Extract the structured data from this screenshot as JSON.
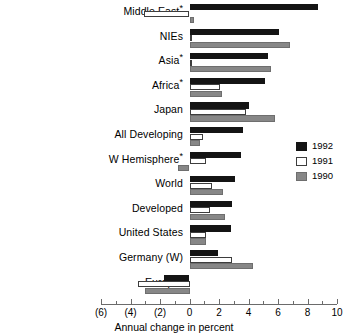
{
  "chart_data": {
    "type": "bar",
    "orientation": "horizontal",
    "title": "",
    "xlabel": "Annual change in percent",
    "ylabel": "",
    "xlim": [
      -6,
      10
    ],
    "xticks": [
      -6,
      -4,
      -2,
      0,
      2,
      4,
      6,
      8,
      10
    ],
    "xtick_labels": [
      "(6)",
      "(4)",
      "(2)",
      "0",
      "2",
      "4",
      "6",
      "8",
      "10"
    ],
    "minor_tick_interval": 1,
    "grid": false,
    "legend_position": "right",
    "categories": [
      "Middle East*",
      "NIEs",
      "Asia*",
      "Africa*",
      "Japan",
      "All Developing",
      "W Hemisphere*",
      "World",
      "Developed",
      "United States",
      "Germany (W)",
      "Europe*"
    ],
    "category_labels": [
      {
        "text": "Middle East",
        "star": true
      },
      {
        "text": "NIEs",
        "star": false
      },
      {
        "text": "Asia",
        "star": true
      },
      {
        "text": "Africa",
        "star": true
      },
      {
        "text": "Japan",
        "star": false
      },
      {
        "text": "All Developing",
        "star": false
      },
      {
        "text": "W Hemisphere",
        "star": true
      },
      {
        "text": "World",
        "star": false
      },
      {
        "text": "Developed",
        "star": false
      },
      {
        "text": "United States",
        "star": false
      },
      {
        "text": "Germany (W)",
        "star": false
      },
      {
        "text": "Europe",
        "star": true
      }
    ],
    "series": [
      {
        "name": "1992",
        "color": "#141414",
        "values": [
          8.7,
          6.1,
          5.3,
          5.1,
          4.0,
          3.6,
          3.5,
          3.1,
          2.9,
          2.8,
          1.9,
          -1.7
        ]
      },
      {
        "name": "1991",
        "color": "#ffffff",
        "values": [
          -3.1,
          0.0,
          0.0,
          2.1,
          3.8,
          0.9,
          1.1,
          1.5,
          1.4,
          1.1,
          2.9,
          -3.5
        ]
      },
      {
        "name": "1990",
        "color": "#878787",
        "values": [
          0.3,
          6.8,
          5.5,
          2.2,
          5.8,
          0.7,
          -0.8,
          2.3,
          2.4,
          1.1,
          4.3,
          -3.0
        ]
      }
    ]
  },
  "legend": {
    "entries": [
      {
        "label": "1992",
        "swatch": "black"
      },
      {
        "label": "1991",
        "swatch": "white"
      },
      {
        "label": "1990",
        "swatch": "gray"
      }
    ]
  },
  "axis": {
    "title": "Annual change in percent"
  },
  "colors": {
    "series_1992": "#141414",
    "series_1991": "#ffffff",
    "series_1990": "#878787",
    "axis": "#6b6b6b",
    "text": "#000000",
    "background": "#ffffff"
  }
}
